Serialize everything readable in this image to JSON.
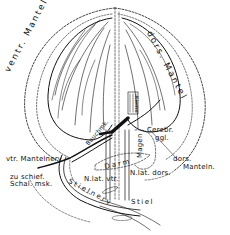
{
  "figure": {
    "labels": {
      "ventr_mantel": "ventr. Mantel",
      "dors_mantel": "dors. Mantel",
      "vtr_mantelnerv": "vtr. Mantelnerv",
      "zu_schief": "zu schief.",
      "schal_msk": "Schal. msk.",
      "bauchmk": "Bauchmk.",
      "kieme": "Kieme",
      "cerebr": "Cerebr.",
      "ggl": "ggl.",
      "magen": "Magen",
      "darm": "Darm",
      "n_lat_vtr": "N.lat. vtr.",
      "n_lat_dors": "N.lat. dors.",
      "dors_manteln": "dors.",
      "mantein": "Manteln.",
      "stielnerv": "Stielnerv",
      "stiel": "Stiel"
    }
  }
}
